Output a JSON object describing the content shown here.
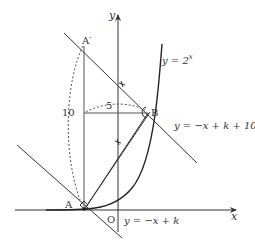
{
  "diagram": {
    "axes": {
      "x_label": "x",
      "y_label": "y",
      "origin_label": "O"
    },
    "points": {
      "A": "A",
      "A_prime": "A′",
      "B": "B"
    },
    "curve_label": {
      "lhs": "y = 2",
      "exp": "x"
    },
    "line_upper_label": "y = −x + k + 10",
    "line_lower_label": "y = −x + k",
    "measure_vertical": "10",
    "measure_horizontal": "5",
    "colors": {
      "stroke": "#333333",
      "background": "#ffffff"
    }
  }
}
